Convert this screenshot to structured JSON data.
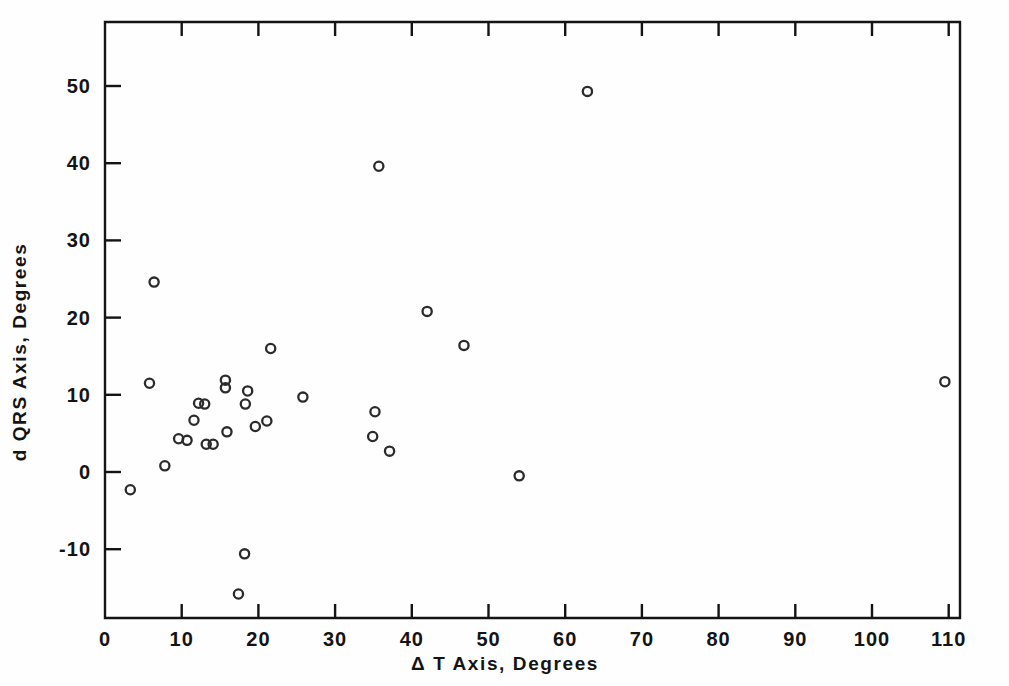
{
  "chart_data": {
    "type": "scatter",
    "title": "",
    "xlabel": "Δ T Axis,  Degrees",
    "ylabel": "d QRS Axis,  Degrees",
    "xlim": [
      0,
      114
    ],
    "ylim": [
      -19,
      57
    ],
    "xticks": [
      0,
      10,
      20,
      30,
      40,
      50,
      60,
      70,
      80,
      90,
      100,
      110
    ],
    "yticks": [
      -10,
      0,
      10,
      20,
      30,
      40,
      50
    ],
    "xticklabels": [
      "0",
      "10",
      "20",
      "30",
      "40",
      "50",
      "60",
      "70",
      "80",
      "90",
      "100",
      "110"
    ],
    "yticklabels": [
      "-10",
      "0",
      "10",
      "20",
      "30",
      "40",
      "50"
    ],
    "grid": false,
    "legend": null,
    "marker": "open-circle",
    "marker_color": "#2b2b2b",
    "points": [
      {
        "x": 3.3,
        "y": -2.3
      },
      {
        "x": 5.8,
        "y": 11.5
      },
      {
        "x": 6.4,
        "y": 24.6
      },
      {
        "x": 7.8,
        "y": 0.8
      },
      {
        "x": 9.6,
        "y": 4.3
      },
      {
        "x": 10.7,
        "y": 4.1
      },
      {
        "x": 11.6,
        "y": 6.7
      },
      {
        "x": 12.2,
        "y": 8.9
      },
      {
        "x": 13.0,
        "y": 8.8
      },
      {
        "x": 13.2,
        "y": 3.6
      },
      {
        "x": 14.1,
        "y": 3.6
      },
      {
        "x": 15.7,
        "y": 11.9
      },
      {
        "x": 15.7,
        "y": 10.9
      },
      {
        "x": 15.9,
        "y": 5.2
      },
      {
        "x": 17.4,
        "y": -15.8
      },
      {
        "x": 18.2,
        "y": -10.6
      },
      {
        "x": 18.3,
        "y": 8.8
      },
      {
        "x": 18.6,
        "y": 10.5
      },
      {
        "x": 19.6,
        "y": 5.9
      },
      {
        "x": 21.1,
        "y": 6.6
      },
      {
        "x": 21.6,
        "y": 16.0
      },
      {
        "x": 25.8,
        "y": 9.7
      },
      {
        "x": 34.9,
        "y": 4.6
      },
      {
        "x": 35.2,
        "y": 7.8
      },
      {
        "x": 35.7,
        "y": 39.6
      },
      {
        "x": 37.1,
        "y": 2.7
      },
      {
        "x": 42.0,
        "y": 20.8
      },
      {
        "x": 46.8,
        "y": 16.4
      },
      {
        "x": 54.0,
        "y": -0.5
      },
      {
        "x": 62.9,
        "y": 49.3
      },
      {
        "x": 109.5,
        "y": 11.7
      }
    ]
  }
}
